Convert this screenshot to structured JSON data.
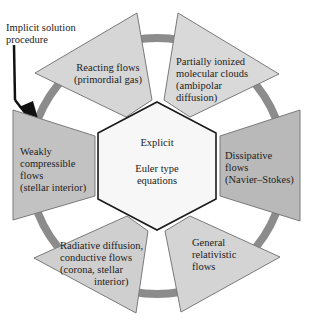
{
  "diagram": {
    "annotation": {
      "lines": [
        "Implicit solution",
        "procedure"
      ]
    },
    "center": {
      "title": "Explicit",
      "subtitle_lines": [
        "Euler type",
        "equations"
      ]
    },
    "segments": [
      {
        "id": "reacting-flows",
        "lines": [
          "Reacting flows",
          "(primordial gas)"
        ],
        "fill": "#d6d6d6"
      },
      {
        "id": "partially-ionized",
        "lines": [
          "Partially ionized",
          "molecular clouds",
          "(ambipolar",
          "diffusion)"
        ],
        "fill": "#d9d9d9"
      },
      {
        "id": "dissipative-flows",
        "lines": [
          "Dissipative",
          "flows",
          "(Navier–Stokes)"
        ],
        "fill": "#b9b9b9"
      },
      {
        "id": "general-relativistic",
        "lines": [
          "General",
          "relativistic",
          "flows"
        ],
        "fill": "#d4d4d4"
      },
      {
        "id": "radiative-diffusion",
        "lines": [
          "Radiative diffusion,",
          "conductive flows",
          "(corona, stellar",
          "interior)"
        ],
        "fill": "#cfcfcf"
      },
      {
        "id": "weakly-compressible",
        "lines": [
          "Weakly",
          "compressible",
          "flows",
          "(stellar interior)"
        ],
        "fill": "#c2c2c2"
      }
    ],
    "colors": {
      "ring": "#8c8c8c",
      "hexagon_fill": "#f7f7f7",
      "hexagon_stroke": "#1a1a1a",
      "segment_stroke": "#7a7a7a",
      "arrow": "#111111"
    }
  }
}
